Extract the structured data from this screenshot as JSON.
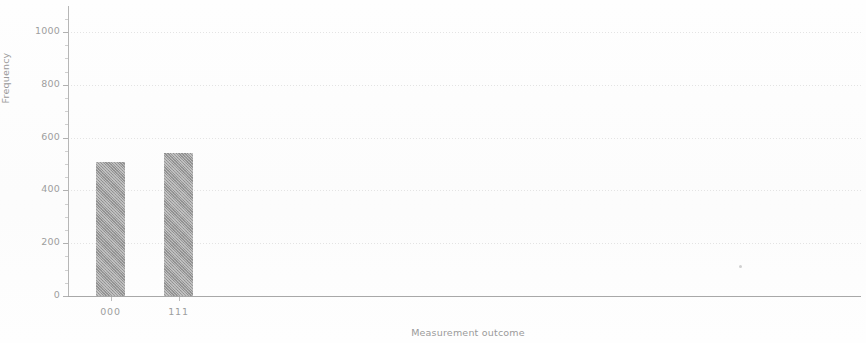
{
  "chart_data": {
    "type": "bar",
    "title": "",
    "subtitle": "",
    "xlabel": "Measurement outcome",
    "ylabel": "Frequency",
    "categories": [
      "000",
      "111"
    ],
    "values": [
      507,
      540
    ],
    "series": [
      {
        "name": "Frequency",
        "values": [
          507,
          540
        ]
      }
    ],
    "ylim": [
      0,
      1100
    ],
    "xlim": [
      0,
      1
    ],
    "yticks": [
      0,
      200,
      400,
      600,
      800,
      1000
    ],
    "ytick_labels": [
      "0",
      "200",
      "400",
      "600",
      "800",
      "1000"
    ],
    "xtick_labels": [
      "000",
      "111"
    ],
    "grid": "horizontal-dotted",
    "legend": "none",
    "bar_color": "#8e8e8e",
    "grid_color": "#e2e2e2",
    "axis_color": "#b0b0b0",
    "text_color": "#9e9e9e",
    "annotations": []
  },
  "figure": {
    "background": "#ffffff"
  }
}
